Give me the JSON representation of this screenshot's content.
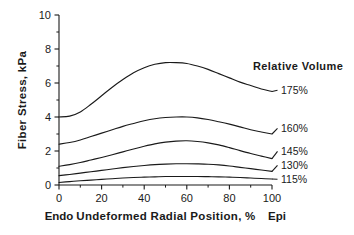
{
  "chart_data": {
    "type": "line",
    "title": "",
    "xlabel": "Undeformed Radial Position, %",
    "ylabel": "Fiber Stress, kPa",
    "xlim": [
      0,
      100
    ],
    "ylim": [
      0,
      10
    ],
    "xticks": [
      "0",
      "20",
      "40",
      "60",
      "80",
      "100"
    ],
    "yticks": [
      "0",
      "2",
      "4",
      "6",
      "8",
      "10"
    ],
    "xtick_values": [
      0,
      20,
      40,
      60,
      80,
      100
    ],
    "ytick_values": [
      0,
      2,
      4,
      6,
      8,
      10
    ],
    "grid": false,
    "legend_position": "right-inline",
    "legend_title": "Relative  Volume",
    "x_axis_start_annotation": "Endo",
    "x_axis_end_annotation": "Epi",
    "line_color": "#1a1a1a",
    "x": [
      0,
      5,
      10,
      15,
      20,
      25,
      30,
      35,
      40,
      45,
      50,
      55,
      60,
      65,
      70,
      75,
      80,
      85,
      90,
      95,
      100
    ],
    "series": [
      {
        "name": "175%",
        "label": "175%",
        "values": [
          4.0,
          4.05,
          4.3,
          4.75,
          5.25,
          5.75,
          6.2,
          6.6,
          6.9,
          7.1,
          7.2,
          7.2,
          7.15,
          7.0,
          6.8,
          6.55,
          6.3,
          6.05,
          5.85,
          5.65,
          5.5
        ]
      },
      {
        "name": "160%",
        "label": "160%",
        "values": [
          2.4,
          2.5,
          2.65,
          2.85,
          3.05,
          3.25,
          3.45,
          3.62,
          3.78,
          3.9,
          3.97,
          4.0,
          4.0,
          3.95,
          3.85,
          3.72,
          3.58,
          3.42,
          3.25,
          3.12,
          3.0
        ]
      },
      {
        "name": "145%",
        "label": "145%",
        "values": [
          1.1,
          1.2,
          1.32,
          1.47,
          1.62,
          1.78,
          1.95,
          2.12,
          2.28,
          2.42,
          2.52,
          2.58,
          2.6,
          2.56,
          2.48,
          2.36,
          2.2,
          2.02,
          1.85,
          1.7,
          1.55
        ]
      },
      {
        "name": "130%",
        "label": "130%",
        "values": [
          0.55,
          0.62,
          0.7,
          0.78,
          0.86,
          0.94,
          1.02,
          1.09,
          1.15,
          1.2,
          1.23,
          1.25,
          1.25,
          1.24,
          1.22,
          1.18,
          1.12,
          1.04,
          0.96,
          0.88,
          0.8
        ]
      },
      {
        "name": "115%",
        "label": "115%",
        "values": [
          0.15,
          0.2,
          0.25,
          0.29,
          0.33,
          0.37,
          0.41,
          0.44,
          0.46,
          0.48,
          0.5,
          0.5,
          0.5,
          0.5,
          0.49,
          0.48,
          0.46,
          0.44,
          0.41,
          0.38,
          0.35
        ]
      }
    ]
  },
  "figure": {
    "background": "#ffffff"
  }
}
